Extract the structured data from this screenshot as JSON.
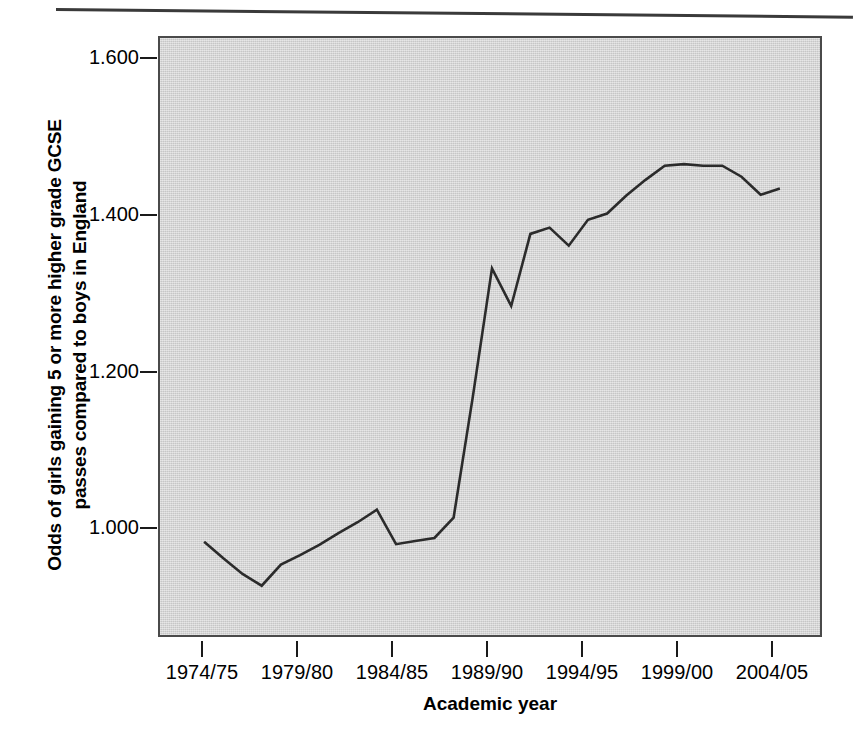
{
  "chart_data": {
    "type": "line",
    "title": "",
    "xlabel": "Academic year",
    "ylabel": "Odds of girls gaining 5 or more higher grade GCSE passes compared to boys in England",
    "ylabel_lines": [
      "Odds of girls gaining 5 or more higher grade GCSE",
      "passes compared to boys in England"
    ],
    "ytick_labels": [
      "1.600",
      "1.400",
      "1.200",
      "1.000"
    ],
    "ytick_values": [
      1.6,
      1.4,
      1.2,
      1.0
    ],
    "xtick_labels": [
      "1974/75",
      "1979/80",
      "1984/85",
      "1989/90",
      "1994/95",
      "1999/00",
      "2004/05"
    ],
    "xtick_values": [
      1974,
      1979,
      1984,
      1989,
      1994,
      1999,
      2004
    ],
    "ylim": [
      0.923,
      1.69
    ],
    "xlim": [
      1971.7,
      2006.3
    ],
    "grid": false,
    "legend": false,
    "categories": [
      "1974/75",
      "1975/76",
      "1976/77",
      "1977/78",
      "1978/79",
      "1979/80",
      "1980/81",
      "1981/82",
      "1982/83",
      "1983/84",
      "1984/85",
      "1985/86",
      "1986/87",
      "1987/88",
      "1988/89",
      "1989/90",
      "1990/91",
      "1991/92",
      "1992/93",
      "1993/94",
      "1994/95",
      "1995/96",
      "1996/97",
      "1997/98",
      "1998/99",
      "1999/00",
      "2000/01",
      "2001/02",
      "2002/03",
      "2003/04",
      "2004/05"
    ],
    "x": [
      1974,
      1975,
      1976,
      1977,
      1978,
      1979,
      1980,
      1981,
      1982,
      1983,
      1984,
      1985,
      1986,
      1987,
      1988,
      1989,
      1990,
      1991,
      1992,
      1993,
      1994,
      1995,
      1996,
      1997,
      1998,
      1999,
      2000,
      2001,
      2002,
      2003,
      2004
    ],
    "values": [
      1.047,
      1.026,
      1.006,
      0.991,
      1.018,
      1.03,
      1.043,
      1.058,
      1.072,
      1.088,
      1.044,
      1.048,
      1.052,
      1.078,
      1.232,
      1.396,
      1.348,
      1.44,
      1.448,
      1.425,
      1.458,
      1.466,
      1.489,
      1.509,
      1.527,
      1.529,
      1.527,
      1.527,
      1.513,
      1.49,
      1.498
    ],
    "series": [
      {
        "name": "Odds ratio girls vs boys",
        "color": "#2b2b2b",
        "values": [
          1.047,
          1.026,
          1.006,
          0.991,
          1.018,
          1.03,
          1.043,
          1.058,
          1.072,
          1.088,
          1.044,
          1.048,
          1.052,
          1.078,
          1.232,
          1.396,
          1.348,
          1.44,
          1.448,
          1.425,
          1.458,
          1.466,
          1.489,
          1.509,
          1.527,
          1.529,
          1.527,
          1.527,
          1.513,
          1.49,
          1.498
        ]
      }
    ],
    "plot_background": "#d4d4d4",
    "line_color": "#2b2b2b",
    "axis_color": "#4a4a4a"
  }
}
